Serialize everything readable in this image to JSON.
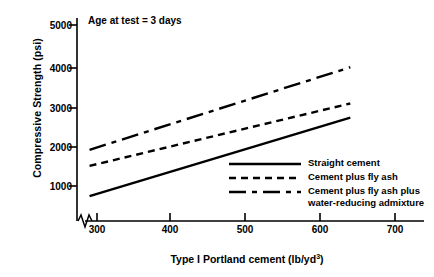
{
  "chart_data": {
    "type": "line",
    "title": "",
    "annotation": "Age at test = 3 days",
    "xlabel": "Type I Portland cement (lb/yd",
    "xlabel_sup": "3",
    "xlabel_close": ")",
    "ylabel": "Compressive Strength (psi)",
    "xlim": [
      265,
      720
    ],
    "ylim": [
      400,
      5400
    ],
    "xticks": [
      300,
      400,
      500,
      600,
      700
    ],
    "xtick_labels": [
      "300",
      "400",
      "500",
      "600",
      "700"
    ],
    "yticks": [
      1000,
      2000,
      3000,
      4000,
      5000
    ],
    "ytick_labels": [
      "1000",
      "2000",
      "3000",
      "4000",
      "5000"
    ],
    "grid": false,
    "axis_break": true,
    "legend_position": "lower-right-inside",
    "line_color": "#000000",
    "series": [
      {
        "name": "Straight cement",
        "style": "solid",
        "x": [
          290,
          640
        ],
        "y": [
          750,
          2700
        ]
      },
      {
        "name": "Cement plus fly ash",
        "style": "dashed",
        "x": [
          290,
          640
        ],
        "y": [
          1500,
          3050
        ]
      },
      {
        "name": "Cement plus fly ash plus\nwater-reducing admixture",
        "style": "dash-dot",
        "x": [
          290,
          640
        ],
        "y": [
          1900,
          3950
        ]
      }
    ]
  },
  "legend": {
    "items": [
      {
        "label": "Straight cement"
      },
      {
        "label": "Cement plus fly ash"
      },
      {
        "label": "Cement plus fly ash plus\nwater-reducing admixture"
      }
    ]
  }
}
